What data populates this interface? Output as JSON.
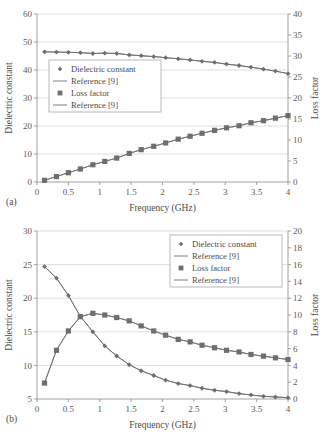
{
  "figure": {
    "panels": [
      {
        "key": "a",
        "label": "(a)",
        "xlabel": "Frequency (GHz)",
        "ylabel_left": "Dielectric constant",
        "ylabel_right": "Loss factor",
        "legend_position": "left-middle",
        "legend": [
          {
            "marker": "diamond",
            "label": "Dielectric constant"
          },
          {
            "marker": "line",
            "label": "Reference [9]"
          },
          {
            "marker": "square",
            "label": "Loss factor"
          },
          {
            "marker": "line",
            "label": "Reference [9]"
          }
        ],
        "chart_data": {
          "type": "line",
          "title": "",
          "xlabel": "Frequency (GHz)",
          "ylabel": "Dielectric constant",
          "ylabel_right": "Loss factor",
          "xlim": [
            0,
            4
          ],
          "ylim": [
            0,
            60
          ],
          "ylim_right": [
            0,
            40
          ],
          "xticks": [
            0,
            0.5,
            1,
            1.5,
            2,
            2.5,
            3,
            3.5,
            4
          ],
          "xticklabels": [
            "0",
            "0.5",
            "1",
            "1.5",
            "2",
            "2.5",
            "3",
            "3.5",
            "4"
          ],
          "yticks": [
            0,
            10,
            20,
            30,
            40,
            50,
            60
          ],
          "yticklabels": [
            "0",
            "10",
            "20",
            "30",
            "40",
            "50",
            "60"
          ],
          "yticks_right": [
            0,
            5,
            10,
            15,
            20,
            25,
            30,
            35,
            40
          ],
          "yticklabels_right": [
            "0",
            "5",
            "10",
            "15",
            "20",
            "25",
            "30",
            "35",
            "40"
          ],
          "grid": true,
          "legend_position": "center left",
          "x": [
            0.12,
            0.31,
            0.5,
            0.69,
            0.89,
            1.08,
            1.27,
            1.47,
            1.66,
            1.86,
            2.05,
            2.25,
            2.44,
            2.63,
            2.83,
            3.02,
            3.22,
            3.41,
            3.61,
            3.8,
            4.0
          ],
          "series": [
            {
              "name": "Dielectric constant",
              "axis": "left",
              "marker": "diamond",
              "values": [
                46.5,
                46.4,
                46.3,
                46.2,
                45.9,
                46.0,
                45.9,
                45.4,
                45.1,
                44.8,
                44.4,
                44.0,
                43.6,
                43.1,
                42.7,
                42.1,
                41.6,
                41.0,
                40.3,
                39.6,
                38.7
              ]
            },
            {
              "name": "Reference [9] (dielectric constant)",
              "axis": "left",
              "marker": "line",
              "values": [
                46.5,
                46.4,
                46.3,
                46.2,
                45.9,
                46.0,
                45.9,
                45.4,
                45.1,
                44.8,
                44.4,
                44.0,
                43.6,
                43.1,
                42.7,
                42.1,
                41.6,
                41.0,
                40.3,
                39.6,
                38.7
              ]
            },
            {
              "name": "Loss factor",
              "axis": "right",
              "marker": "square",
              "values": [
                0.4,
                1.3,
                2.2,
                3.1,
                4.1,
                4.9,
                5.7,
                6.8,
                7.7,
                8.5,
                9.3,
                10.2,
                10.9,
                11.6,
                12.3,
                12.9,
                13.4,
                14.1,
                14.6,
                15.2,
                15.8
              ]
            },
            {
              "name": "Reference [9] (loss factor)",
              "axis": "right",
              "marker": "line",
              "values": [
                0.4,
                1.3,
                2.2,
                3.1,
                4.1,
                4.9,
                5.7,
                6.8,
                7.7,
                8.5,
                9.3,
                10.2,
                10.9,
                11.6,
                12.3,
                12.9,
                13.4,
                14.1,
                14.6,
                15.2,
                15.8
              ]
            }
          ]
        }
      },
      {
        "key": "b",
        "label": "(b)",
        "xlabel": "Frequency (GHz)",
        "ylabel_left": "Dielectric constant",
        "ylabel_right": "Loss factor",
        "legend_position": "top-right",
        "legend": [
          {
            "marker": "diamond",
            "label": "Dielectric constant"
          },
          {
            "marker": "line",
            "label": "Reference [9]"
          },
          {
            "marker": "square",
            "label": "Loss factor"
          },
          {
            "marker": "line",
            "label": "Reference [9]"
          }
        ],
        "chart_data": {
          "type": "line",
          "title": "",
          "xlabel": "Frequency (GHz)",
          "ylabel": "Dielectric constant",
          "ylabel_right": "Loss factor",
          "xlim": [
            0,
            4
          ],
          "ylim": [
            5,
            30
          ],
          "ylim_right": [
            0,
            20
          ],
          "xticks": [
            0,
            0.5,
            1,
            1.5,
            2,
            2.5,
            3,
            3.5,
            4
          ],
          "xticklabels": [
            "0",
            "0.5",
            "1",
            "1.5",
            "2",
            "2.5",
            "3",
            "3.5",
            "4"
          ],
          "yticks": [
            5,
            10,
            15,
            20,
            25,
            30
          ],
          "yticklabels": [
            "5",
            "10",
            "15",
            "20",
            "25",
            "30"
          ],
          "yticks_right": [
            0,
            2,
            4,
            6,
            8,
            10,
            12,
            14,
            16,
            18,
            20
          ],
          "yticklabels_right": [
            "0",
            "2",
            "4",
            "6",
            "8",
            "10",
            "12",
            "14",
            "16",
            "18",
            "20"
          ],
          "grid": true,
          "legend_position": "upper right",
          "x": [
            0.12,
            0.31,
            0.5,
            0.69,
            0.89,
            1.08,
            1.27,
            1.47,
            1.66,
            1.86,
            2.05,
            2.25,
            2.44,
            2.63,
            2.83,
            3.02,
            3.22,
            3.41,
            3.61,
            3.8,
            4.0
          ],
          "series": [
            {
              "name": "Dielectric constant",
              "axis": "left",
              "marker": "diamond",
              "values": [
                24.7,
                23.0,
                20.4,
                17.3,
                15.0,
                12.9,
                11.4,
                10.1,
                9.2,
                8.5,
                7.8,
                7.3,
                7.0,
                6.6,
                6.3,
                6.1,
                5.8,
                5.6,
                5.4,
                5.3,
                5.2
              ]
            },
            {
              "name": "Reference [9] (dielectric constant)",
              "axis": "left",
              "marker": "line",
              "values": [
                24.7,
                23.0,
                20.4,
                17.3,
                15.0,
                12.9,
                11.4,
                10.1,
                9.2,
                8.5,
                7.8,
                7.3,
                7.0,
                6.6,
                6.3,
                6.1,
                5.8,
                5.6,
                5.4,
                5.3,
                5.2
              ]
            },
            {
              "name": "Loss factor",
              "axis": "right",
              "marker": "square",
              "values": [
                1.9,
                5.8,
                8.1,
                9.8,
                10.2,
                10.0,
                9.7,
                9.3,
                8.7,
                8.1,
                7.6,
                7.1,
                6.8,
                6.4,
                6.1,
                5.8,
                5.6,
                5.3,
                5.1,
                4.9,
                4.7
              ]
            },
            {
              "name": "Reference [9] (loss factor)",
              "axis": "right",
              "marker": "line",
              "values": [
                1.9,
                5.8,
                8.1,
                9.8,
                10.2,
                10.0,
                9.7,
                9.3,
                8.7,
                8.1,
                7.6,
                7.1,
                6.8,
                6.4,
                6.1,
                5.8,
                5.6,
                5.3,
                5.1,
                4.9,
                4.7
              ]
            }
          ]
        }
      }
    ]
  }
}
